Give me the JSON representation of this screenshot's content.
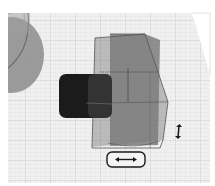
{
  "viewport": {
    "label": "3D workplane viewport",
    "colors": {
      "background": "#ffffff",
      "grid_plane": "#efefef",
      "grid_line": "#d6d6d6",
      "grid_line_major": "#c4c4c4",
      "dark_shape": "#1c1c1c",
      "ghost_shape": "#6a6a6a",
      "outline": "#555555",
      "left_object": "#8a8a8a"
    }
  },
  "handles": {
    "horizontal_move": {
      "icon": "double-arrow-horizontal-icon",
      "glyph": "⟷"
    },
    "vertical_move": {
      "icon": "double-arrow-vertical-icon",
      "glyph": "↕"
    }
  },
  "objects": [
    {
      "name": "cylinder-object-left",
      "type": "cylinder"
    },
    {
      "name": "dark-box-object",
      "type": "box"
    },
    {
      "name": "selected-ghost-box-object",
      "type": "box"
    }
  ]
}
